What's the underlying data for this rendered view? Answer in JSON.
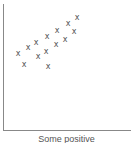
{
  "chart_data": {
    "type": "scatter",
    "title": "",
    "caption": "Some positive",
    "xlabel": "",
    "ylabel": "",
    "grid": false,
    "legend": null,
    "marker": "x",
    "marker_color": "#555555",
    "axis_color": "#888888",
    "points_px": [
      {
        "x": 77,
        "y": 18
      },
      {
        "x": 68,
        "y": 24
      },
      {
        "x": 74,
        "y": 32
      },
      {
        "x": 57,
        "y": 31
      },
      {
        "x": 65,
        "y": 40
      },
      {
        "x": 47,
        "y": 37
      },
      {
        "x": 56,
        "y": 45
      },
      {
        "x": 36,
        "y": 43
      },
      {
        "x": 46,
        "y": 52
      },
      {
        "x": 28,
        "y": 48
      },
      {
        "x": 18,
        "y": 54
      },
      {
        "x": 38,
        "y": 57
      },
      {
        "x": 24,
        "y": 65
      },
      {
        "x": 48,
        "y": 67
      }
    ],
    "points": [
      {
        "x": 7.3,
        "y": 8.9
      },
      {
        "x": 6.4,
        "y": 8.4
      },
      {
        "x": 7.0,
        "y": 7.8
      },
      {
        "x": 5.3,
        "y": 7.9
      },
      {
        "x": 6.1,
        "y": 7.1
      },
      {
        "x": 4.3,
        "y": 7.4
      },
      {
        "x": 5.2,
        "y": 6.7
      },
      {
        "x": 3.2,
        "y": 6.8
      },
      {
        "x": 4.2,
        "y": 6.1
      },
      {
        "x": 2.4,
        "y": 6.4
      },
      {
        "x": 1.5,
        "y": 5.9
      },
      {
        "x": 3.4,
        "y": 5.7
      },
      {
        "x": 2.0,
        "y": 5.0
      },
      {
        "x": 4.4,
        "y": 4.9
      }
    ],
    "xlim": [
      0,
      10
    ],
    "ylim": [
      0,
      10
    ]
  },
  "marker_glyph": "x"
}
